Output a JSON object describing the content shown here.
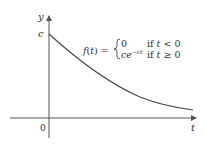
{
  "diagram": {
    "type": "function-graph",
    "axes": {
      "y_label": "y",
      "x_label": "t",
      "origin_label": "0",
      "y_intercept_label": "c"
    },
    "formula": {
      "lhs": "f(t) =",
      "case1_value": "0",
      "case1_condition": "if  t < 0",
      "case2_value": "ce",
      "case2_exponent": "−ct",
      "case2_condition": "if  t ≥ 0"
    },
    "curve": {
      "description": "exponential decay starting at (0, c)",
      "color": "#444444"
    },
    "colors": {
      "axis": "#555555",
      "curve": "#444444",
      "text": "#333333"
    }
  }
}
